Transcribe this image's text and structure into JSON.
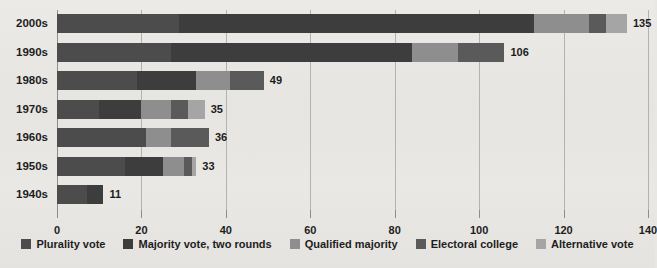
{
  "chart_data": {
    "type": "bar",
    "orientation": "horizontal",
    "stacked": true,
    "title": "",
    "xlabel": "",
    "ylabel": "",
    "xlim": [
      0,
      140
    ],
    "xticks": [
      0,
      20,
      40,
      60,
      80,
      100,
      120,
      140
    ],
    "grid": true,
    "legend_position": "bottom",
    "categories": [
      "2000s",
      "1990s",
      "1980s",
      "1970s",
      "1960s",
      "1950s",
      "1940s"
    ],
    "totals": [
      135,
      106,
      49,
      35,
      36,
      33,
      11
    ],
    "series": [
      {
        "name": "Plurality vote",
        "color": "#4c4c4c",
        "values": [
          29,
          27,
          19,
          10,
          21,
          16,
          7
        ]
      },
      {
        "name": "Majority vote, two rounds",
        "color": "#3d3d3d",
        "values": [
          84,
          57,
          14,
          10,
          0,
          9,
          4
        ]
      },
      {
        "name": "Qualified majority",
        "color": "#8e8e8e",
        "values": [
          13,
          11,
          8,
          7,
          6,
          5,
          0
        ]
      },
      {
        "name": "Electoral college",
        "color": "#5a5a5a",
        "values": [
          4,
          11,
          8,
          4,
          9,
          2,
          0
        ]
      },
      {
        "name": "Alternative vote",
        "color": "#a5a5a5",
        "values": [
          5,
          0,
          0,
          4,
          0,
          1,
          0
        ]
      }
    ]
  }
}
